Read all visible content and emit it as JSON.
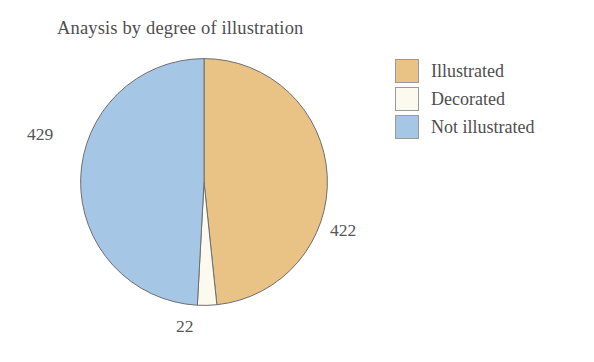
{
  "chart_data": {
    "type": "pie",
    "title": "Anaysis by degree of illustration",
    "categories": [
      "Illustrated",
      "Decorated",
      "Not illustrated"
    ],
    "values": [
      422,
      22,
      429
    ],
    "total": 873,
    "labels": [
      "422",
      "22",
      "429"
    ],
    "colors": [
      "#e8c385",
      "#fcfaee",
      "#a5c7e5"
    ],
    "slice_border_color": "#6e6e72",
    "start_angle_deg": 0,
    "direction": "clockwise",
    "legend_position": "right",
    "grid": false,
    "xlabel": "",
    "ylabel": ""
  },
  "title": {
    "text": "Anaysis by degree of illustration"
  },
  "legend": {
    "items": [
      {
        "label": "Illustrated",
        "color": "#e8c385"
      },
      {
        "label": "Decorated",
        "color": "#fcfaee"
      },
      {
        "label": "Not illustrated",
        "color": "#a5c7e5"
      }
    ]
  },
  "labels": {
    "illustrated": "422",
    "decorated": "22",
    "not_illustrated": "429"
  },
  "colors": {
    "background": "#ffffff",
    "text": "#4e4e50",
    "illustrated": "#e8c385",
    "decorated": "#fcfaee",
    "not_illustrated": "#a5c7e5",
    "outline": "#6e6e72"
  }
}
